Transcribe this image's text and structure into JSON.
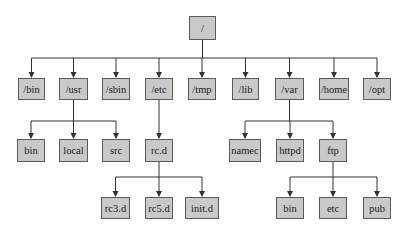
{
  "diagram": {
    "type": "tree",
    "title": "",
    "line_color": "#333333",
    "node_fill": "#c9c9c9",
    "node_border": "#5a5a5a",
    "nodes": [
      {
        "id": "root",
        "label": "/",
        "x": 189,
        "y": 16,
        "w": 27,
        "h": 24
      },
      {
        "id": "bin",
        "label": "/bin",
        "x": 18,
        "y": 78,
        "w": 27,
        "h": 22
      },
      {
        "id": "usr",
        "label": "/usr",
        "x": 59,
        "y": 78,
        "w": 29,
        "h": 22
      },
      {
        "id": "sbin",
        "label": "/sbin",
        "x": 102,
        "y": 78,
        "w": 28,
        "h": 22
      },
      {
        "id": "etc",
        "label": "/etc",
        "x": 145,
        "y": 78,
        "w": 28,
        "h": 22
      },
      {
        "id": "tmp",
        "label": "/tmp",
        "x": 188,
        "y": 78,
        "w": 28,
        "h": 22
      },
      {
        "id": "lib",
        "label": "/lib",
        "x": 232,
        "y": 78,
        "w": 27,
        "h": 22
      },
      {
        "id": "var",
        "label": "/var",
        "x": 275,
        "y": 78,
        "w": 29,
        "h": 22
      },
      {
        "id": "home",
        "label": "/home",
        "x": 319,
        "y": 78,
        "w": 30,
        "h": 22
      },
      {
        "id": "opt",
        "label": "/opt",
        "x": 363,
        "y": 78,
        "w": 28,
        "h": 22
      },
      {
        "id": "usr_bin",
        "label": "bin",
        "x": 17,
        "y": 139,
        "w": 28,
        "h": 23
      },
      {
        "id": "usr_local",
        "label": "local",
        "x": 59,
        "y": 139,
        "w": 29,
        "h": 23
      },
      {
        "id": "usr_src",
        "label": "src",
        "x": 102,
        "y": 139,
        "w": 28,
        "h": 23
      },
      {
        "id": "rcd",
        "label": "rc.d",
        "x": 145,
        "y": 139,
        "w": 28,
        "h": 23
      },
      {
        "id": "rc3d",
        "label": "rc3.d",
        "x": 101,
        "y": 197,
        "w": 29,
        "h": 22
      },
      {
        "id": "rc5d",
        "label": "rc5.d",
        "x": 145,
        "y": 197,
        "w": 28,
        "h": 22
      },
      {
        "id": "initd",
        "label": "init.d",
        "x": 185,
        "y": 197,
        "w": 34,
        "h": 22
      },
      {
        "id": "namec",
        "label": "namec",
        "x": 229,
        "y": 139,
        "w": 32,
        "h": 23
      },
      {
        "id": "httpd",
        "label": "httpd",
        "x": 276,
        "y": 139,
        "w": 28,
        "h": 23
      },
      {
        "id": "ftp",
        "label": "ftp",
        "x": 319,
        "y": 139,
        "w": 28,
        "h": 23
      },
      {
        "id": "ftp_bin",
        "label": "bin",
        "x": 276,
        "y": 197,
        "w": 28,
        "h": 22
      },
      {
        "id": "ftp_etc",
        "label": "etc",
        "x": 319,
        "y": 197,
        "w": 28,
        "h": 22
      },
      {
        "id": "ftp_pub",
        "label": "pub",
        "x": 363,
        "y": 197,
        "w": 28,
        "h": 22
      }
    ],
    "edges": [
      {
        "from": "root",
        "to": [
          "bin",
          "usr",
          "sbin",
          "etc",
          "tmp",
          "lib",
          "var",
          "home",
          "opt"
        ],
        "bar_y": 58
      },
      {
        "from": "usr",
        "to": [
          "usr_bin",
          "usr_local",
          "usr_src"
        ],
        "bar_y": 121
      },
      {
        "from": "etc",
        "to": [
          "rcd"
        ],
        "bar_y": 121
      },
      {
        "from": "rcd",
        "to": [
          "rc3d",
          "rc5d",
          "initd"
        ],
        "bar_y": 177
      },
      {
        "from": "var",
        "to": [
          "namec",
          "httpd",
          "ftp"
        ],
        "bar_y": 121
      },
      {
        "from": "ftp",
        "to": [
          "ftp_bin",
          "ftp_etc",
          "ftp_pub"
        ],
        "bar_y": 177
      }
    ]
  }
}
